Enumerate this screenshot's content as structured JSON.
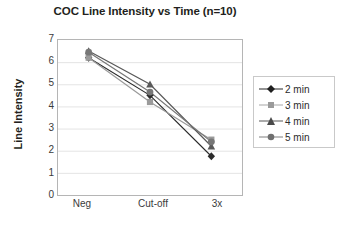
{
  "chart_data": {
    "type": "line",
    "title": "COC Line Intensity vs Time (n=10)",
    "xlabel": "",
    "ylabel": "Line Intensity",
    "categories": [
      "Neg",
      "Cut-off",
      "3x"
    ],
    "ylim": [
      0,
      7
    ],
    "yticks": [
      0,
      1,
      2,
      3,
      4,
      5,
      6,
      7
    ],
    "grid": true,
    "legend_position": "right",
    "series": [
      {
        "name": "2 min",
        "marker": "diamond",
        "color": "#2b2b2b",
        "values": [
          6.2,
          4.5,
          1.75
        ]
      },
      {
        "name": "3 min",
        "marker": "square",
        "color": "#9a9a9a",
        "values": [
          6.2,
          4.2,
          2.5
        ]
      },
      {
        "name": "4 min",
        "marker": "triangle",
        "color": "#595959",
        "values": [
          6.5,
          5.0,
          2.2
        ]
      },
      {
        "name": "5 min",
        "marker": "circle",
        "color": "#777777",
        "values": [
          6.45,
          4.65,
          2.4
        ]
      }
    ]
  },
  "axis": {
    "y_tick_labels": [
      "7",
      "6",
      "5",
      "4",
      "3",
      "2",
      "1",
      "0"
    ],
    "x_tick_labels": [
      "Neg",
      "Cut-off",
      "3x"
    ]
  },
  "legend": {
    "items": [
      {
        "label": "2 min"
      },
      {
        "label": "3 min"
      },
      {
        "label": "4 min"
      },
      {
        "label": "5 min"
      }
    ]
  }
}
